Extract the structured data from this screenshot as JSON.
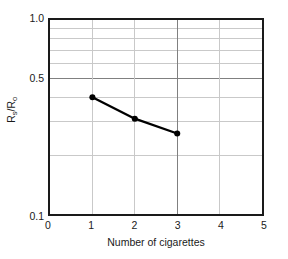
{
  "chart_data": {
    "type": "line",
    "title": "",
    "xlabel": "Number of cigarettes",
    "ylabel": "Rs/Ro",
    "ylabel_parts": {
      "pre": "R",
      "sub1": "s",
      "mid": "/R",
      "sub2": "o"
    },
    "x": [
      1,
      2,
      3
    ],
    "values": [
      0.4,
      0.31,
      0.26
    ],
    "series": [
      {
        "name": "Rs/Ro",
        "x": [
          1,
          2,
          3
        ],
        "values": [
          0.4,
          0.31,
          0.26
        ]
      }
    ],
    "xlim": [
      0,
      5
    ],
    "ylim": [
      0.1,
      1.0
    ],
    "yscale": "log",
    "xscale": "linear",
    "xticks": [
      0,
      1,
      2,
      3,
      4,
      5
    ],
    "xtick_labels": [
      "0",
      "1",
      "2",
      "3",
      "4",
      "5"
    ],
    "yticks": [
      0.1,
      0.5,
      1.0
    ],
    "ytick_labels": [
      "0.1",
      "0.5",
      "1.0"
    ],
    "y_minor_gridlines": [
      0.2,
      0.3,
      0.4,
      0.6,
      0.7,
      0.8,
      0.9
    ],
    "x_major_gridlines": [
      3
    ],
    "x_minor_gridlines": [
      1,
      2,
      4
    ],
    "grid": true,
    "legend": "none",
    "marker": "filled-circle",
    "line_color": "#000000",
    "marker_color": "#000000",
    "major_grid_color": "#808080",
    "minor_grid_color": "#c8c8c8",
    "frame_color": "#1a1a1a",
    "background": "#ffffff"
  }
}
